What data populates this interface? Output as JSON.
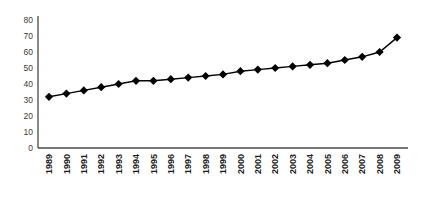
{
  "chart_data": {
    "type": "line",
    "title": "",
    "subtitle": "",
    "xlabel": "",
    "ylabel": "",
    "categories": [
      "1989",
      "1990",
      "1991",
      "1992",
      "1993",
      "1994",
      "1995",
      "1996",
      "1997",
      "1998",
      "1999",
      "2000",
      "2001",
      "2002",
      "2003",
      "2004",
      "2005",
      "2006",
      "2007",
      "2008",
      "2009"
    ],
    "values": [
      32,
      34,
      36,
      38,
      40,
      42,
      42,
      43,
      44,
      45,
      46,
      48,
      49,
      50,
      51,
      52,
      53,
      55,
      57,
      60,
      69
    ],
    "series": [
      {
        "name": "",
        "values": [
          32,
          34,
          36,
          38,
          40,
          42,
          42,
          43,
          44,
          45,
          46,
          48,
          49,
          50,
          51,
          52,
          53,
          55,
          57,
          60,
          69
        ]
      }
    ],
    "ylim": [
      0,
      80
    ],
    "ytick_values": [
      0,
      10,
      20,
      30,
      40,
      50,
      60,
      70,
      80
    ],
    "ytick_labels": [
      "0",
      "10",
      "20",
      "30",
      "40",
      "50",
      "60",
      "70",
      "80"
    ],
    "xtick_labels": [
      "1989",
      "1990",
      "1991",
      "1992",
      "1993",
      "1994",
      "1995",
      "1996",
      "1997",
      "1998",
      "1999",
      "2000",
      "2001",
      "2002",
      "2003",
      "2004",
      "2005",
      "2006",
      "2007",
      "2008",
      "2009"
    ],
    "xtick_rotation": 90,
    "grid": false,
    "legend": false,
    "legend_position": "none",
    "marker": "diamond",
    "line_color": "#000000",
    "marker_color": "#000000",
    "axis_color": "#4a4a4a",
    "background_color": "#ffffff"
  }
}
